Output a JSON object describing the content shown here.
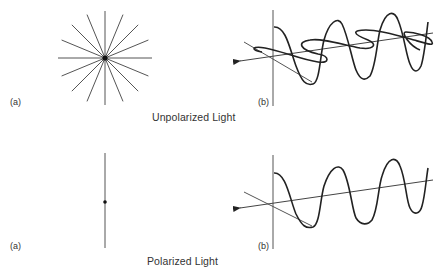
{
  "figure": {
    "top": {
      "caption": "Unpolarized Light",
      "panel_a_label": "(a)",
      "panel_b_label": "(b)",
      "panel_a": {
        "shape": "star-burst",
        "rays": 16,
        "center": [
          105,
          58
        ],
        "radius": 47
      },
      "panel_b": {
        "shape": "two perpendicular sine waves along propagation axis",
        "waves": 2
      }
    },
    "bottom": {
      "caption": "Polarized Light",
      "panel_a_label": "(a)",
      "panel_b_label": "(b)",
      "panel_a": {
        "shape": "single vertical line with center dot"
      },
      "panel_b": {
        "shape": "single sine wave along propagation axis",
        "waves": 1
      }
    },
    "footer_text": "",
    "colors": {
      "ink": "#2a2a2a",
      "light_ink": "#555555",
      "background": "#ffffff"
    }
  }
}
